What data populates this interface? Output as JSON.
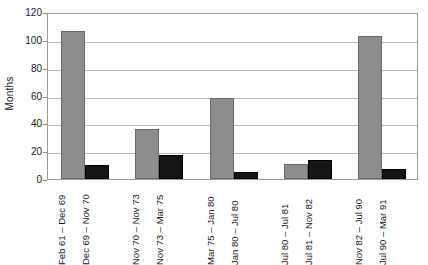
{
  "chart_data": {
    "type": "bar",
    "title": "",
    "xlabel": "",
    "ylabel": "Months",
    "ylim": [
      0,
      120
    ],
    "yticks": [
      0,
      20,
      40,
      60,
      80,
      100,
      120
    ],
    "grid": true,
    "legend": "none",
    "categories": [
      "Feb 61 – Dec 69",
      "Dec 69 – Nov 70",
      "Nov 70 – Nov 73",
      "Nov 73 – Mar 75",
      "Mar 75 – Jan 80",
      "Jan 80 – Jul 80",
      "Jul 80 – Jul 81",
      "Jul 81 – Nov 82",
      "Nov 82 – Jul 90",
      "Jul 90 – Mar 91"
    ],
    "values": [
      106,
      10,
      36,
      17,
      58,
      5,
      11,
      14,
      103,
      7
    ],
    "groups": [
      {
        "bars": [
          {
            "label": "Feb 61 – Dec 69",
            "value": 106,
            "series": "a"
          },
          {
            "label": "Dec 69 – Nov 70",
            "value": 10,
            "series": "b"
          }
        ]
      },
      {
        "bars": [
          {
            "label": "Nov 70 – Nov 73",
            "value": 36,
            "series": "a"
          },
          {
            "label": "Nov 73 – Mar 75",
            "value": 17,
            "series": "b"
          }
        ]
      },
      {
        "bars": [
          {
            "label": "Mar 75 – Jan 80",
            "value": 58,
            "series": "a"
          },
          {
            "label": "Jan 80 – Jul 80",
            "value": 5,
            "series": "b"
          }
        ]
      },
      {
        "bars": [
          {
            "label": "Jul 80 – Jul 81",
            "value": 11,
            "series": "a"
          },
          {
            "label": "Jul 81 – Nov 82",
            "value": 14,
            "series": "b"
          }
        ]
      },
      {
        "bars": [
          {
            "label": "Nov 82 – Jul 90",
            "value": 103,
            "series": "a"
          },
          {
            "label": "Jul 90 – Mar 91",
            "value": 7,
            "series": "b"
          }
        ]
      }
    ],
    "colors": {
      "series_a": "#8d8d8d",
      "series_b": "#151515",
      "gridline": "#b9b9b9",
      "axis": "#9a9a9a",
      "text": "#1a1a1a",
      "background": "#ffffff"
    }
  }
}
